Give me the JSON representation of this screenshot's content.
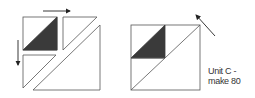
{
  "diagram": {
    "caption": {
      "line1": "Unit C -",
      "line2": "make 80"
    },
    "colors": {
      "stroke": "#555555",
      "fill_dark": "#3a3a3a",
      "background": "#ffffff"
    },
    "left_figure": {
      "description": "exploded unit: small half-square triangle, two side triangles, large triangle",
      "arrows": [
        "right",
        "down"
      ]
    },
    "right_figure": {
      "description": "assembled square unit with dark triangle in upper-left quadrant",
      "arrows": [
        "up-left"
      ]
    }
  }
}
